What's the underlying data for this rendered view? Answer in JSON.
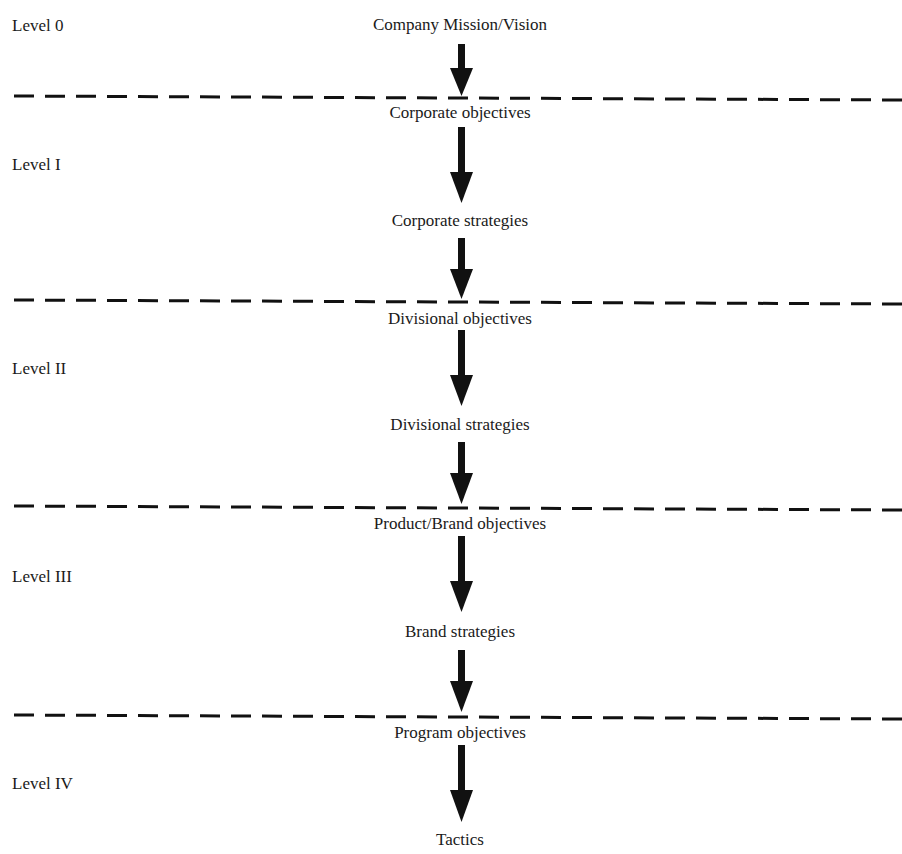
{
  "diagram": {
    "type": "hierarchy-flow",
    "title_cut_off": "",
    "levels": [
      {
        "label": "Level 0"
      },
      {
        "label": "Level I"
      },
      {
        "label": "Level II"
      },
      {
        "label": "Level III"
      },
      {
        "label": "Level IV"
      }
    ],
    "nodes": [
      {
        "label": "Company Mission/Vision",
        "level": "Level 0"
      },
      {
        "label": "Corporate objectives",
        "level": "Level I"
      },
      {
        "label": "Corporate strategies",
        "level": "Level I"
      },
      {
        "label": "Divisional objectives",
        "level": "Level II"
      },
      {
        "label": "Divisional strategies",
        "level": "Level II"
      },
      {
        "label": "Product/Brand objectives",
        "level": "Level III"
      },
      {
        "label": "Brand strategies",
        "level": "Level III"
      },
      {
        "label": "Program objectives",
        "level": "Level IV"
      },
      {
        "label": "Tactics",
        "level": "Level IV"
      }
    ],
    "edges": [
      [
        "Company Mission/Vision",
        "Corporate objectives"
      ],
      [
        "Corporate objectives",
        "Corporate strategies"
      ],
      [
        "Corporate strategies",
        "Divisional objectives"
      ],
      [
        "Divisional objectives",
        "Divisional strategies"
      ],
      [
        "Divisional strategies",
        "Product/Brand objectives"
      ],
      [
        "Product/Brand objectives",
        "Brand strategies"
      ],
      [
        "Brand strategies",
        "Program objectives"
      ],
      [
        "Program objectives",
        "Tactics"
      ]
    ],
    "separators": 4,
    "colors": {
      "ink": "#111111",
      "background": "#ffffff"
    }
  }
}
